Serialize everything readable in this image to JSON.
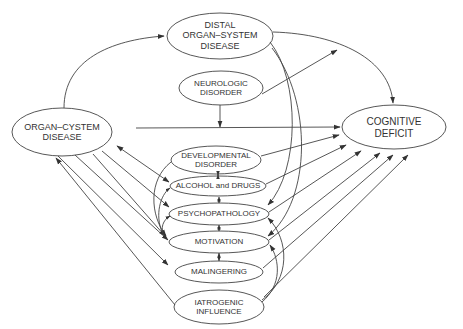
{
  "diagram": {
    "nodes": {
      "distal": {
        "lines": [
          "DISTAL",
          "ORGAN–SYSTEM",
          "DISEASE"
        ]
      },
      "neurologic": {
        "lines": [
          "NEUROLOGIC",
          "DISORDER"
        ]
      },
      "organ": {
        "lines": [
          "ORGAN–CYSTEM",
          "DISEASE"
        ]
      },
      "cognitive": {
        "lines": [
          "COGNITIVE",
          "DEFICIT"
        ]
      },
      "developmental": {
        "lines": [
          "DEVELOPMENTAL",
          "DISORDER"
        ]
      },
      "alcohol": {
        "lines": [
          "ALCOHOL and DRUGS"
        ]
      },
      "psychopathology": {
        "lines": [
          "PSYCHOPATHOLOGY"
        ]
      },
      "motivation": {
        "lines": [
          "MOTIVATION"
        ]
      },
      "malingering": {
        "lines": [
          "MALINGERING"
        ]
      },
      "iatrogenic": {
        "lines": [
          "IATROGENIC",
          "INFLUENCE"
        ]
      }
    },
    "edges": [
      {
        "from": "ORGAN–CYSTEM DISEASE",
        "to": "DISTAL ORGAN–SYSTEM DISEASE"
      },
      {
        "from": "DISTAL ORGAN–SYSTEM DISEASE",
        "to": "COGNITIVE DEFICIT"
      },
      {
        "from": "NEUROLOGIC DISORDER",
        "to": "COGNITIVE DEFICIT"
      },
      {
        "from": "NEUROLOGIC DISORDER",
        "to": "ORGAN→COGNITIVE line"
      },
      {
        "from": "ORGAN–CYSTEM DISEASE",
        "to": "COGNITIVE DEFICIT"
      },
      {
        "from": "DEVELOPMENTAL DISORDER",
        "to": "COGNITIVE DEFICIT"
      },
      {
        "from": "ALCOHOL and DRUGS",
        "to": "COGNITIVE DEFICIT"
      },
      {
        "from": "PSYCHOPATHOLOGY",
        "to": "COGNITIVE DEFICIT"
      },
      {
        "from": "MOTIVATION",
        "to": "COGNITIVE DEFICIT"
      },
      {
        "from": "MALINGERING",
        "to": "COGNITIVE DEFICIT"
      },
      {
        "from": "IATROGENIC INFLUENCE",
        "to": "COGNITIVE DEFICIT"
      },
      {
        "from": "DISTAL ORGAN–SYSTEM DISEASE",
        "to": "PSYCHOPATHOLOGY"
      },
      {
        "from": "DISTAL ORGAN–SYSTEM DISEASE",
        "to": "MOTIVATION"
      },
      {
        "from": "ORGAN–CYSTEM DISEASE",
        "to": "ALCOHOL and DRUGS",
        "bidirectional": true
      },
      {
        "from": "ORGAN–CYSTEM DISEASE",
        "to": "PSYCHOPATHOLOGY"
      },
      {
        "from": "ORGAN–CYSTEM DISEASE",
        "to": "MOTIVATION"
      },
      {
        "from": "ORGAN–CYSTEM DISEASE",
        "to": "MALINGERING"
      },
      {
        "from": "IATROGENIC INFLUENCE",
        "to": "ORGAN–CYSTEM DISEASE"
      },
      {
        "from": "DEVELOPMENTAL DISORDER",
        "to": "ALCOHOL and DRUGS",
        "bidirectional": true
      },
      {
        "from": "ALCOHOL and DRUGS",
        "to": "PSYCHOPATHOLOGY",
        "bidirectional": true
      },
      {
        "from": "PSYCHOPATHOLOGY",
        "to": "MOTIVATION",
        "bidirectional": true
      },
      {
        "from": "MOTIVATION",
        "to": "MALINGERING",
        "bidirectional": true
      },
      {
        "from": "IATROGENIC INFLUENCE",
        "to": "PSYCHOPATHOLOGY"
      },
      {
        "from": "IATROGENIC INFLUENCE",
        "to": "MOTIVATION"
      }
    ],
    "colors": {
      "stroke": "#333333",
      "text": "#333333",
      "background": "#ffffff"
    }
  }
}
